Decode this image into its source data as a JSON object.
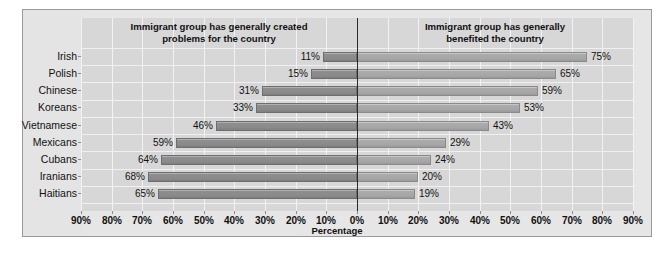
{
  "chart_data": {
    "type": "bar",
    "subtype": "diverging-horizontal-bar",
    "title": "",
    "xlabel": "Percentage",
    "ylabel": "",
    "grid": true,
    "legend_position": "none",
    "axis_ticks": [
      "90%",
      "80%",
      "70%",
      "60%",
      "50%",
      "40%",
      "30%",
      "20%",
      "10%",
      "0%",
      "10%",
      "20%",
      "30%",
      "40%",
      "50%",
      "60%",
      "70%",
      "80%",
      "90%"
    ],
    "xlim": [
      -90,
      90
    ],
    "categories": [
      "Irish",
      "Polish",
      "Chinese",
      "Koreans",
      "Vietnamese",
      "Mexicans",
      "Cubans",
      "Iranians",
      "Haitians"
    ],
    "series": [
      {
        "name": "Immigrant group has generally created problems for the country",
        "direction": "left",
        "values": [
          11,
          15,
          31,
          33,
          46,
          59,
          64,
          68,
          65
        ],
        "labels": [
          "11%",
          "15%",
          "31%",
          "33%",
          "46%",
          "59%",
          "64%",
          "68%",
          "65%"
        ],
        "color": "#8a8a8a"
      },
      {
        "name": "Immigrant group has generally benefited the country",
        "direction": "right",
        "values": [
          75,
          65,
          59,
          53,
          43,
          29,
          24,
          20,
          19
        ],
        "labels": [
          "75%",
          "65%",
          "59%",
          "53%",
          "43%",
          "29%",
          "24%",
          "20%",
          "19%"
        ],
        "color": "#a6a6a6"
      }
    ]
  },
  "headers": {
    "left_line1": "Immigrant group has generally created",
    "left_line2": "problems for the country",
    "right_line1": "Immigrant group has generally",
    "right_line2": "benefited the country"
  },
  "colors": {
    "panel_background": "#e6e6e6",
    "plot_background": "#d7d7d7",
    "zero_line": "#2a2a2a",
    "grid": "#f2f2f2",
    "bar_negative": "#8a8a8a",
    "bar_positive": "#a6a6a6",
    "text": "#111111",
    "border": "#9a9a9a"
  }
}
